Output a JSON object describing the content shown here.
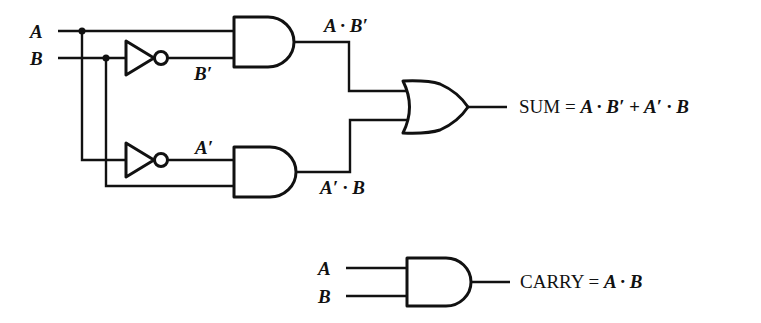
{
  "diagram": {
    "type": "logic-circuit",
    "inputs": [
      {
        "id": "A",
        "label": "A"
      },
      {
        "id": "B",
        "label": "B"
      }
    ],
    "gates": [
      {
        "id": "inv-b",
        "type": "NOT",
        "input": "B",
        "output_label": "B′"
      },
      {
        "id": "inv-a",
        "type": "NOT",
        "input": "A",
        "output_label": "A′"
      },
      {
        "id": "and-top",
        "type": "AND",
        "inputs": [
          "A",
          "B′"
        ],
        "output_label": "A · B′"
      },
      {
        "id": "and-bottom",
        "type": "AND",
        "inputs": [
          "A′",
          "B"
        ],
        "output_label": "A′ · B"
      },
      {
        "id": "or-sum",
        "type": "OR",
        "inputs": [
          "A · B′",
          "A′ · B"
        ]
      },
      {
        "id": "and-carry",
        "type": "AND",
        "inputs": [
          "A",
          "B"
        ]
      }
    ],
    "labels": {
      "in_a": "A",
      "in_b": "B",
      "b_not": "B′",
      "a_not": "A′",
      "a_and_bnot": "A · B′",
      "anot_and_b": "A′ · B",
      "sum_word": "SUM",
      "sum_eq": "=",
      "sum_expr": "A · B′ + A′ · B",
      "carry_in_a": "A",
      "carry_in_b": "B",
      "carry_word": "CARRY",
      "carry_eq": "=",
      "carry_expr": "A · B"
    },
    "colors": {
      "ink": "#111111",
      "background": "#ffffff"
    }
  }
}
